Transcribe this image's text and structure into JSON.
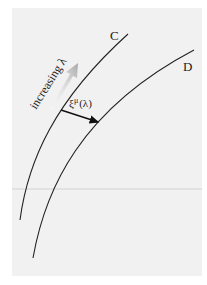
{
  "figure": {
    "curves": [
      {
        "id": "C",
        "label": "C"
      },
      {
        "id": "D",
        "label": "D"
      }
    ],
    "direction_label": "increasing λ",
    "deviation_vector_label": "ξ",
    "deviation_vector_superscript": "μ",
    "deviation_vector_argument": "(λ)",
    "colors": {
      "panel": "#f1f1f1",
      "curve": "#222222",
      "arrow": "#111111",
      "direction_arrow": "#b0b0b0"
    }
  }
}
